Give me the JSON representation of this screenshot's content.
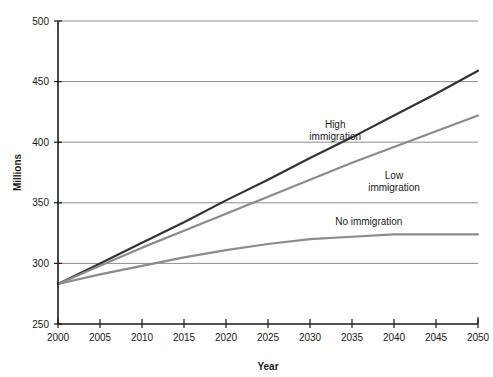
{
  "chart_data": {
    "type": "line",
    "title": "",
    "xlabel": "Year",
    "ylabel": "Millions",
    "xlim": [
      2000,
      2050
    ],
    "ylim": [
      250,
      500
    ],
    "grid": true,
    "legend_position": "inline-annotations",
    "x": [
      2000,
      2005,
      2010,
      2015,
      2020,
      2025,
      2030,
      2035,
      2040,
      2045,
      2050
    ],
    "xticks": [
      "2000",
      "2005",
      "2010",
      "2015",
      "2020",
      "2025",
      "2030",
      "2035",
      "2040",
      "2045",
      "2050"
    ],
    "yticks": [
      "250",
      "300",
      "350",
      "400",
      "450",
      "500"
    ],
    "series": [
      {
        "name": "High immigration",
        "color": "#333333",
        "width": 2.2,
        "label_x": 2033,
        "label_y": 412,
        "values": [
          283,
          300,
          317,
          334,
          352,
          369,
          387,
          404,
          422,
          440,
          459
        ]
      },
      {
        "name": "Low immigration",
        "color": "#8a8a8f",
        "width": 2.2,
        "label_x": 2040,
        "label_y": 370,
        "values": [
          283,
          298,
          313,
          327,
          341,
          355,
          369,
          383,
          396,
          409,
          422
        ]
      },
      {
        "name": "No immigration",
        "color": "#8a8a8f",
        "width": 2.2,
        "label_x": 2037,
        "label_y": 332,
        "values": [
          283,
          291,
          298,
          305,
          311,
          316,
          320,
          322,
          324,
          324,
          324
        ]
      }
    ]
  },
  "axes": {
    "y_title": "Millions",
    "x_title": "Year"
  }
}
